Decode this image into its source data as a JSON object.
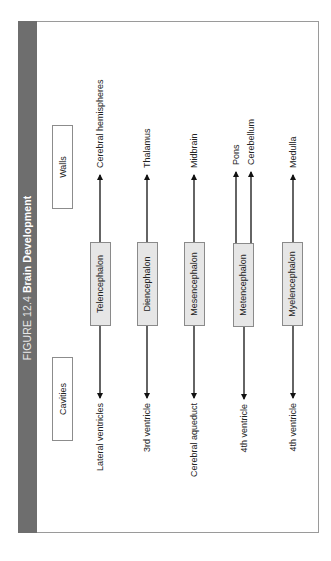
{
  "figure": {
    "label": "FIGURE 12.4",
    "title": "Brain Development",
    "orientation": "rotated 90° counter-clockwise"
  },
  "headers": {
    "walls": "Walls",
    "cavities": "Cavities"
  },
  "colors": {
    "title_bar": "#6e6e6e",
    "box_fill": "#e6e6e6",
    "box_border": "#8a8a8a",
    "arrow": "#111111"
  },
  "divisions": [
    {
      "name": "Telencephalon",
      "walls": [
        "Cerebral hemispheres"
      ],
      "cavity": "Lateral ventricles"
    },
    {
      "name": "Diencephalon",
      "walls": [
        "Thalamus"
      ],
      "cavity": "3rd ventricle"
    },
    {
      "name": "Mesencephalon",
      "walls": [
        "Midbrain"
      ],
      "cavity": "Cerebral aqueduct"
    },
    {
      "name": "Metencephalon",
      "walls": [
        "Pons",
        "Cerebellum"
      ],
      "cavity": "4th ventricle"
    },
    {
      "name": "Myelencephalon",
      "walls": [
        "Medulla"
      ],
      "cavity": "4th ventricle"
    }
  ]
}
